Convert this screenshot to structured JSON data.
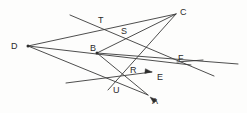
{
  "figure": {
    "background_color": "#fdfdfc",
    "line_color": "#3a3a3a",
    "label_color": "#2b2b2b",
    "width": 247,
    "height": 113,
    "points": [
      {
        "id": "C",
        "label": "C",
        "label_x": 180,
        "label_y": 8,
        "x": 176,
        "y": 14,
        "kind": "endpoint-vertex"
      },
      {
        "id": "T",
        "label": "T",
        "label_x": 98,
        "label_y": 16,
        "x": 101,
        "y": 23,
        "kind": "intersection"
      },
      {
        "id": "S",
        "label": "S",
        "label_x": 121,
        "label_y": 27,
        "x": 124,
        "y": 34,
        "kind": "intersection"
      },
      {
        "id": "D",
        "label": "D",
        "label_x": 11,
        "label_y": 42,
        "x": 28,
        "y": 46,
        "kind": "vertex"
      },
      {
        "id": "B",
        "label": "B",
        "label_x": 90,
        "label_y": 44,
        "x": 97,
        "y": 53,
        "kind": "vertex"
      },
      {
        "id": "F",
        "label": "F",
        "label_x": 178,
        "label_y": 54,
        "x": 177,
        "y": 62,
        "kind": "intersection"
      },
      {
        "id": "R",
        "label": "R",
        "label_x": 130,
        "label_y": 66,
        "x": 136,
        "y": 74,
        "kind": "intersection"
      },
      {
        "id": "E",
        "label": "E",
        "label_x": 157,
        "label_y": 73,
        "x": 152,
        "y": 72,
        "kind": "arrow-tip"
      },
      {
        "id": "U",
        "label": "U",
        "label_x": 113,
        "label_y": 86,
        "x": 116,
        "y": 84,
        "kind": "intersection"
      },
      {
        "id": "A",
        "label": "A",
        "label_x": 152,
        "label_y": 97,
        "x": 150,
        "y": 97,
        "kind": "arrow-tip"
      }
    ],
    "segments": [
      {
        "name": "d-to-c",
        "x1": 28,
        "y1": 46,
        "x2": 176,
        "y2": 14
      },
      {
        "name": "d-to-f",
        "x1": 28,
        "y1": 46,
        "x2": 191,
        "y2": 65
      },
      {
        "name": "d-to-a",
        "x1": 28,
        "y1": 46,
        "x2": 148,
        "y2": 95
      },
      {
        "name": "c-to-u-long",
        "x1": 176,
        "y1": 14,
        "x2": 108,
        "y2": 90
      },
      {
        "name": "c-to-b",
        "x1": 176,
        "y1": 14,
        "x2": 97,
        "y2": 53
      },
      {
        "name": "b-to-f-right",
        "x1": 97,
        "y1": 53,
        "x2": 238,
        "y2": 64
      },
      {
        "name": "b-to-a",
        "x1": 97,
        "y1": 53,
        "x2": 148,
        "y2": 95
      },
      {
        "name": "t-steep-line",
        "x1": 70,
        "y1": 15,
        "x2": 214,
        "y2": 76
      },
      {
        "name": "u-shallow-line",
        "x1": 66,
        "y1": 83,
        "x2": 152,
        "y2": 72
      },
      {
        "name": "f-tail-right",
        "x1": 177,
        "y1": 62,
        "x2": 203,
        "y2": 60
      }
    ],
    "arrows": [
      {
        "name": "arrow-to-e",
        "tip_x": 152,
        "tip_y": 72,
        "angle_deg": 188
      },
      {
        "name": "arrow-to-a",
        "tip_x": 150,
        "tip_y": 97,
        "angle_deg": 40
      }
    ],
    "vertex_dots": [
      {
        "name": "vertex-dot-b",
        "x": 97,
        "y": 53
      },
      {
        "name": "vertex-dot-d",
        "x": 28,
        "y": 46
      }
    ]
  }
}
